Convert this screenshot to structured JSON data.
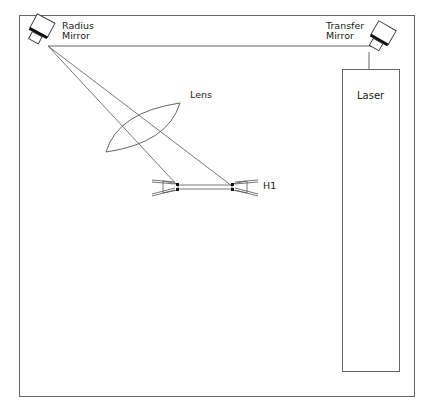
{
  "diagram": {
    "type": "optical-setup",
    "labels": {
      "radius_mirror": "Radius\nMirror",
      "radius_mirror_line1": "Radius",
      "radius_mirror_line2": "Mirror",
      "transfer_mirror_line1": "Transfer",
      "transfer_mirror_line2": "Mirror",
      "lens": "Lens",
      "laser": "Laser",
      "hologram": "H1"
    },
    "colors": {
      "line": "#555555",
      "frame": "#666666",
      "mirror_band": "#111111",
      "background": "#ffffff"
    },
    "components": [
      {
        "name": "radius-mirror",
        "position": [
          38,
          30
        ]
      },
      {
        "name": "transfer-mirror",
        "position": [
          380,
          36
        ]
      },
      {
        "name": "laser",
        "box": [
          342,
          69,
          400,
          371
        ]
      },
      {
        "name": "lens",
        "center": [
          143,
          128
        ]
      },
      {
        "name": "h1-plate",
        "from": [
          178,
          187
        ],
        "to": [
          232,
          187
        ]
      }
    ]
  }
}
